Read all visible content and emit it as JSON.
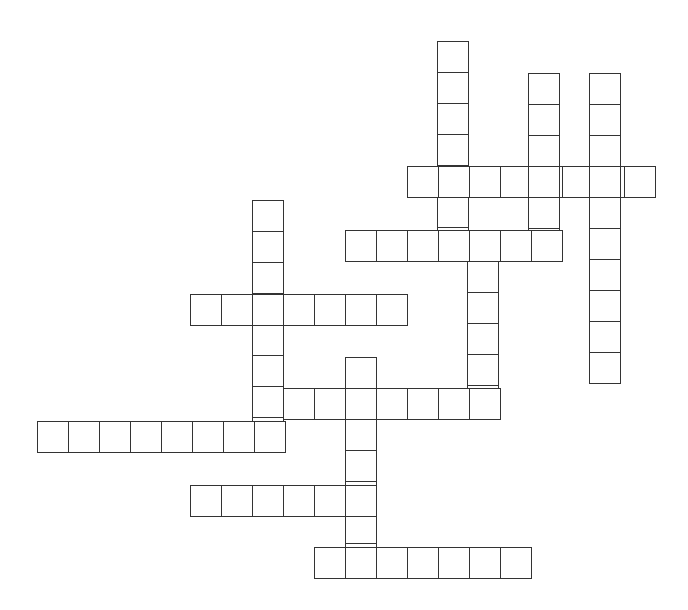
{
  "puzzle": {
    "type": "crossword",
    "cell_size": 31,
    "colors": {
      "border": "#333333",
      "fill": "#ffffff",
      "background": "#ffffff"
    },
    "words": [
      {
        "id": "A",
        "direction": "down",
        "x": 437,
        "y": 41,
        "length": 7
      },
      {
        "id": "B",
        "direction": "across",
        "x": 407,
        "y": 166,
        "length": 8
      },
      {
        "id": "C",
        "direction": "down",
        "x": 528,
        "y": 73,
        "length": 6
      },
      {
        "id": "D",
        "direction": "down",
        "x": 589,
        "y": 73,
        "length": 10
      },
      {
        "id": "E",
        "direction": "across",
        "x": 345,
        "y": 230,
        "length": 7
      },
      {
        "id": "F",
        "direction": "down",
        "x": 467,
        "y": 230,
        "length": 6
      },
      {
        "id": "G",
        "direction": "down",
        "x": 252,
        "y": 200,
        "length": 8
      },
      {
        "id": "H",
        "direction": "across",
        "x": 190,
        "y": 294,
        "length": 7
      },
      {
        "id": "I",
        "direction": "across",
        "x": 252,
        "y": 388,
        "length": 8
      },
      {
        "id": "J",
        "direction": "across",
        "x": 37,
        "y": 421,
        "length": 8
      },
      {
        "id": "K",
        "direction": "down",
        "x": 345,
        "y": 357,
        "length": 7
      },
      {
        "id": "L",
        "direction": "across",
        "x": 190,
        "y": 485,
        "length": 6
      },
      {
        "id": "M",
        "direction": "across",
        "x": 314,
        "y": 547,
        "length": 7
      }
    ]
  }
}
